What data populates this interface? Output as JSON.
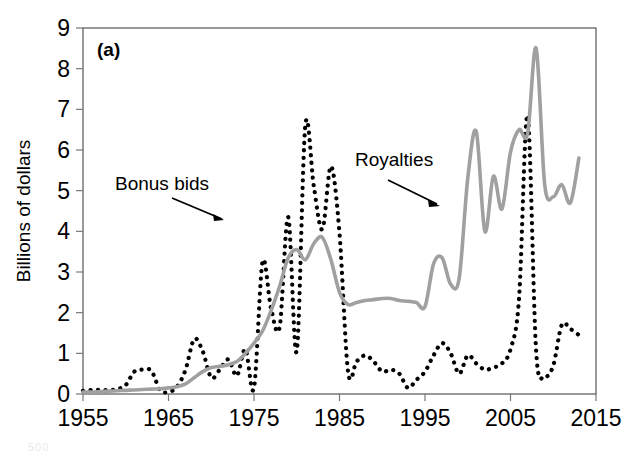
{
  "figure": {
    "panel_label": "(a)",
    "background_color": "#ffffff"
  },
  "axis": {
    "y_title": "Billions of dollars",
    "y_ticks": [
      "0",
      "1",
      "2",
      "3",
      "4",
      "5",
      "6",
      "7",
      "8",
      "9"
    ],
    "x_ticks": [
      "1955",
      "1965",
      "1975",
      "1985",
      "1995",
      "2005",
      "2015"
    ]
  },
  "annotations": [
    {
      "label": "Bonus bids",
      "series": "bonus-bids"
    },
    {
      "label": "Royalties",
      "series": "royalties"
    }
  ],
  "footer": {
    "fragment": "500"
  },
  "chart_data": {
    "type": "line",
    "title": "(a)",
    "xlabel": "",
    "ylabel": "Billions of dollars",
    "xlim": [
      1955,
      2015
    ],
    "ylim": [
      0,
      9
    ],
    "grid": false,
    "legend": "annotated-inline",
    "x_ticks": [
      1955,
      1965,
      1975,
      1985,
      1995,
      2005,
      2015
    ],
    "y_ticks": [
      0,
      1,
      2,
      3,
      4,
      5,
      6,
      7,
      8,
      9
    ],
    "series": [
      {
        "name": "Bonus bids",
        "style": "dotted",
        "color": "#000000",
        "x": [
          1955,
          1956,
          1957,
          1958,
          1959,
          1960,
          1961,
          1962,
          1963,
          1964,
          1965,
          1966,
          1967,
          1968,
          1969,
          1970,
          1971,
          1972,
          1973,
          1974,
          1975,
          1976,
          1977,
          1978,
          1979,
          1980,
          1981,
          1982,
          1983,
          1984,
          1985,
          1986,
          1987,
          1988,
          1989,
          1990,
          1991,
          1992,
          1993,
          1994,
          1995,
          1996,
          1997,
          1998,
          1999,
          2000,
          2001,
          2002,
          2003,
          2004,
          2005,
          2006,
          2007,
          2008,
          2009,
          2010,
          2011,
          2012,
          2013
        ],
        "values": [
          0.08,
          0.1,
          0.1,
          0.1,
          0.12,
          0.22,
          0.55,
          0.6,
          0.57,
          0.1,
          0.05,
          0.18,
          0.6,
          1.35,
          1.05,
          0.4,
          0.6,
          0.85,
          0.45,
          1.1,
          0.15,
          3.25,
          2.1,
          1.65,
          4.35,
          1.05,
          6.6,
          5.1,
          4.05,
          5.6,
          3.95,
          0.55,
          0.8,
          0.95,
          0.8,
          0.55,
          0.6,
          0.5,
          0.15,
          0.35,
          0.55,
          0.95,
          1.25,
          1.0,
          0.5,
          0.95,
          0.75,
          0.6,
          0.65,
          0.75,
          1.1,
          2.35,
          6.85,
          1.05,
          0.45,
          0.7,
          1.7,
          1.6,
          1.45
        ]
      },
      {
        "name": "Royalties",
        "style": "solid",
        "color": "#a0a0a0",
        "x": [
          1955,
          1956,
          1957,
          1958,
          1959,
          1960,
          1961,
          1962,
          1963,
          1964,
          1965,
          1966,
          1967,
          1968,
          1969,
          1970,
          1971,
          1972,
          1973,
          1974,
          1975,
          1976,
          1977,
          1978,
          1979,
          1980,
          1981,
          1982,
          1983,
          1984,
          1985,
          1986,
          1987,
          1988,
          1989,
          1990,
          1991,
          1992,
          1993,
          1994,
          1995,
          1996,
          1997,
          1998,
          1999,
          2000,
          2001,
          2002,
          2003,
          2004,
          2005,
          2006,
          2007,
          2008,
          2009,
          2010,
          2011,
          2012,
          2013
        ],
        "values": [
          0.05,
          0.05,
          0.06,
          0.07,
          0.08,
          0.09,
          0.1,
          0.11,
          0.12,
          0.13,
          0.15,
          0.18,
          0.25,
          0.4,
          0.55,
          0.65,
          0.68,
          0.72,
          0.8,
          1.0,
          1.25,
          1.55,
          2.05,
          2.65,
          3.35,
          3.55,
          3.3,
          3.7,
          3.85,
          3.3,
          2.5,
          2.2,
          2.25,
          2.3,
          2.32,
          2.35,
          2.35,
          2.3,
          2.28,
          2.25,
          2.15,
          3.2,
          3.35,
          2.7,
          2.85,
          5.3,
          6.45,
          4.0,
          5.35,
          4.55,
          5.95,
          6.5,
          6.4,
          8.5,
          5.15,
          4.85,
          5.15,
          4.7,
          5.8
        ]
      }
    ]
  }
}
